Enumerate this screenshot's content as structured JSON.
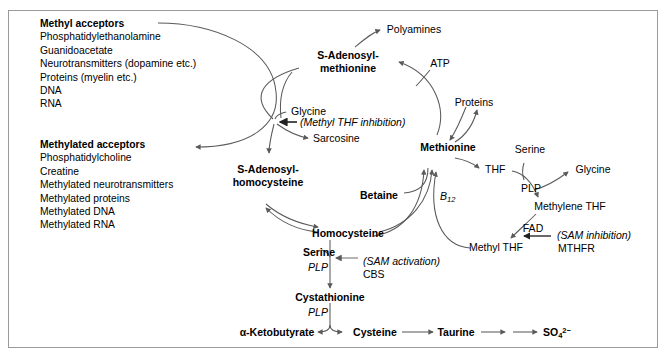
{
  "boxes": {
    "methyl_acceptors": {
      "heading": "Methyl acceptors",
      "items": [
        "Phosphatidylethanolamine",
        "Guanidoacetate",
        "Neurotransmitters (dopamine etc.)",
        "Proteins (myelin etc.)",
        "DNA",
        "RNA"
      ]
    },
    "methylated_acceptors": {
      "heading": "Methylated acceptors",
      "items": [
        "Phosphatidylcholine",
        "Creatine",
        "Methylated neurotransmitters",
        "Methylated proteins",
        "Methylated DNA",
        "Methylated RNA"
      ]
    }
  },
  "nodes": {
    "polyamines": "Polyamines",
    "sam_line1": "S-Adenosyl-",
    "sam_line2": "methionine",
    "atp": "ATP",
    "glycine_left": "Glycine",
    "methyl_thf_inhibition": "(Methyl THF inhibition)",
    "sarcosine": "Sarcosine",
    "sah_line1": "S-Adenosyl-",
    "sah_line2": "homocysteine",
    "proteins": "Proteins",
    "methionine": "Methionine",
    "serine_right": "Serine",
    "thf": "THF",
    "plp_right": "PLP",
    "glycine_right": "Glycine",
    "methylene_thf": "Methylene THF",
    "fad": "FAD",
    "sam_inhibition": "(SAM inhibition)",
    "mthfr": "MTHFR",
    "betaine": "Betaine",
    "b12": "B",
    "b12_sub": "12",
    "homocysteine": "Homocysteine",
    "methyl_thf": "Methyl THF",
    "serine_left": "Serine",
    "plp_cbs": "PLP",
    "sam_activation": "(SAM activation)",
    "cbs": "CBS",
    "cystathionine": "Cystathionine",
    "plp_cystathionine": "PLP",
    "ketobutyrate": "α-Ketobutyrate",
    "cysteine": "Cysteine",
    "taurine": "Taurine",
    "sulfate": "SO",
    "sulfate_sub": "4",
    "sulfate_sup": "2−"
  },
  "colors": {
    "stroke": "#5a5a5a",
    "frame": "#9a9a9a",
    "text": "#000000",
    "background": "#ffffff"
  }
}
